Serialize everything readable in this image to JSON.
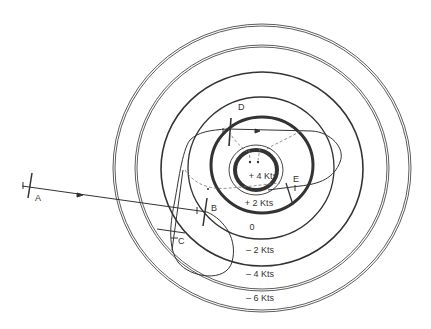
{
  "diagram": {
    "type": "tidal-current-rings-navigation",
    "colors": {
      "ink": "#333333",
      "dash": "#777777",
      "background": "#ffffff"
    },
    "center": {
      "x": 262,
      "y": 168
    },
    "rings": [
      {
        "id": "outer-double",
        "rx": 148,
        "ry": 143,
        "style": "double"
      },
      {
        "id": "second-double",
        "rx": 126,
        "ry": 122,
        "style": "double"
      },
      {
        "id": "third-thick",
        "rx": 101,
        "ry": 97,
        "style": "medium"
      },
      {
        "id": "zero-line",
        "rx": 73,
        "ry": 71,
        "style": "thin"
      },
      {
        "id": "plus-two-thick",
        "rx": 51,
        "ry": 48,
        "style": "thick"
      },
      {
        "id": "plus-four-thin",
        "rx": 27,
        "ry": 25,
        "style": "thin"
      },
      {
        "id": "plus-four-thick",
        "rx": 21,
        "ry": 20,
        "style": "thick"
      }
    ],
    "speed_labels": [
      {
        "text": "+ 4 Kts",
        "x": 263,
        "y": 179
      },
      {
        "text": "+ 2 Kts",
        "x": 259,
        "y": 206
      },
      {
        "text": "0",
        "x": 252,
        "y": 230
      },
      {
        "text": "– 2 Kts",
        "x": 260,
        "y": 253
      },
      {
        "text": "– 4 Kts",
        "x": 260,
        "y": 277
      },
      {
        "text": "– 6 Kts",
        "x": 260,
        "y": 301
      }
    ],
    "points": [
      {
        "label": "A",
        "x": 35,
        "y": 201
      },
      {
        "label": "B",
        "x": 211,
        "y": 211
      },
      {
        "label": "C",
        "x": 178,
        "y": 244
      },
      {
        "label": "D",
        "x": 242,
        "y": 110
      },
      {
        "label": "E",
        "x": 293,
        "y": 182
      }
    ]
  }
}
